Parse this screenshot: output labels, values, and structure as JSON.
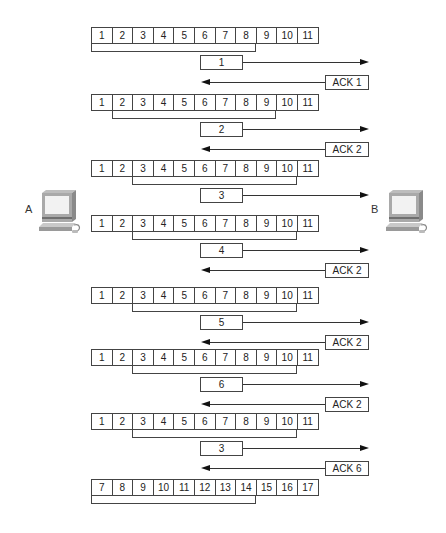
{
  "hosts": {
    "sender": "A",
    "receiver": "B"
  },
  "steps": [
    {
      "window": {
        "cells": [
          "1",
          "2",
          "3",
          "4",
          "5",
          "6",
          "7",
          "8",
          "9",
          "10",
          "11"
        ],
        "bracket_from": 0,
        "bracket_to": 7
      },
      "segment": "1",
      "ack": "ACK 1"
    },
    {
      "window": {
        "cells": [
          "1",
          "2",
          "3",
          "4",
          "5",
          "6",
          "7",
          "8",
          "9",
          "10",
          "11"
        ],
        "bracket_from": 1,
        "bracket_to": 8
      },
      "segment": "2",
      "ack": "ACK 2"
    },
    {
      "window": {
        "cells": [
          "1",
          "2",
          "3",
          "4",
          "5",
          "6",
          "7",
          "8",
          "9",
          "10",
          "11"
        ],
        "bracket_from": 2,
        "bracket_to": 9
      },
      "segment": "3",
      "ack": null
    },
    {
      "window": {
        "cells": [
          "1",
          "2",
          "3",
          "4",
          "5",
          "6",
          "7",
          "8",
          "9",
          "10",
          "11"
        ],
        "bracket_from": 2,
        "bracket_to": 9
      },
      "segment": "4",
      "ack": "ACK 2"
    },
    {
      "window": {
        "cells": [
          "1",
          "2",
          "3",
          "4",
          "5",
          "6",
          "7",
          "8",
          "9",
          "10",
          "11"
        ],
        "bracket_from": 2,
        "bracket_to": 9
      },
      "segment": "5",
      "ack": "ACK 2"
    },
    {
      "window": {
        "cells": [
          "1",
          "2",
          "3",
          "4",
          "5",
          "6",
          "7",
          "8",
          "9",
          "10",
          "11"
        ],
        "bracket_from": 2,
        "bracket_to": 9
      },
      "segment": "6",
      "ack": "ACK 2"
    },
    {
      "window": {
        "cells": [
          "1",
          "2",
          "3",
          "4",
          "5",
          "6",
          "7",
          "8",
          "9",
          "10",
          "11"
        ],
        "bracket_from": 2,
        "bracket_to": 9
      },
      "segment": "3",
      "ack": "ACK 6"
    },
    {
      "window": {
        "cells": [
          "7",
          "8",
          "9",
          "10",
          "11",
          "12",
          "13",
          "14",
          "15",
          "16",
          "17"
        ],
        "bracket_from": 0,
        "bracket_to": 7
      },
      "segment": null,
      "ack": null
    }
  ]
}
